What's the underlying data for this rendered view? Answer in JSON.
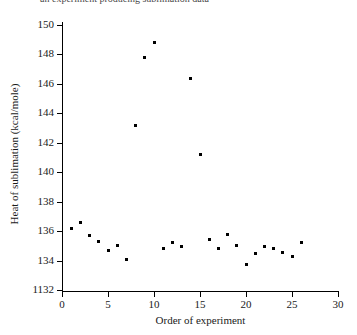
{
  "figure": {
    "cropped_caption_fragment": "an experiment producing sublimation data",
    "xtitle": "Order of experiment",
    "ytitle": "Heat of sublimation (kcal/mole)",
    "marker_color": "#000000",
    "axis_color": "#000000",
    "background": "#ffffff"
  },
  "axes": {
    "y_ticks": [
      "150",
      "148",
      "146",
      "144",
      "142",
      "140",
      "138",
      "136",
      "134",
      "1132"
    ],
    "x_ticks": [
      "0",
      "5",
      "10",
      "15",
      "20",
      "25",
      "30"
    ]
  },
  "chart_data": {
    "type": "scatter",
    "title": "",
    "xlabel": "Order of experiment",
    "ylabel": "Heat of sublimation (kcal/mole)",
    "xlim": [
      0,
      30
    ],
    "ylim": [
      132,
      150
    ],
    "grid": false,
    "legend": "none",
    "x": [
      1,
      2,
      3,
      4,
      5,
      6,
      7,
      8,
      9,
      10,
      11,
      12,
      13,
      14,
      15,
      16,
      17,
      18,
      19,
      20,
      21,
      22,
      23,
      24,
      25,
      26
    ],
    "values": [
      136.2,
      136.6,
      135.7,
      135.3,
      134.7,
      135.0,
      134.1,
      143.2,
      147.8,
      148.8,
      134.85,
      135.2,
      134.95,
      146.4,
      141.2,
      135.4,
      134.85,
      135.8,
      135.05,
      133.75,
      134.5,
      134.95,
      134.85,
      134.55,
      134.3,
      135.2
    ],
    "point_labels": [
      "1",
      "2",
      "3",
      "4",
      "5",
      "6",
      "7",
      "8",
      "9",
      "10",
      "11",
      "12",
      "13",
      "14",
      "15",
      "16",
      "17",
      "18",
      "19",
      "20",
      "21",
      "22",
      "23",
      "24",
      "25",
      "26"
    ]
  }
}
